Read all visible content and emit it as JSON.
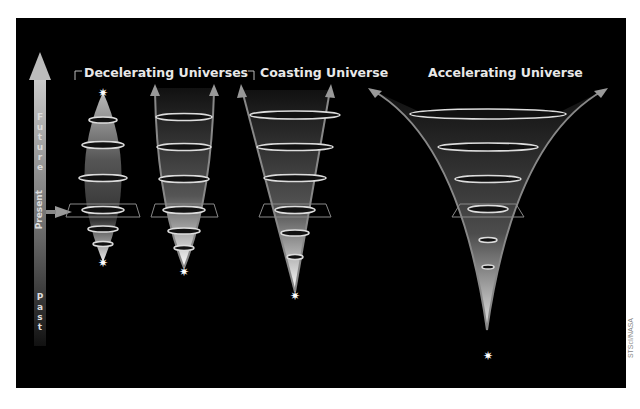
{
  "titles": {
    "decelerating": "Decelerating Universes",
    "coasting": "Coasting Universe",
    "accelerating": "Accelerating Universe"
  },
  "time_axis": {
    "future": "Future",
    "present": "Present",
    "past": "Past"
  },
  "credit": "STScI/NASA",
  "colors": {
    "background": "#000000",
    "cone": "#9a9a9a",
    "text": "#e8e8e8"
  }
}
